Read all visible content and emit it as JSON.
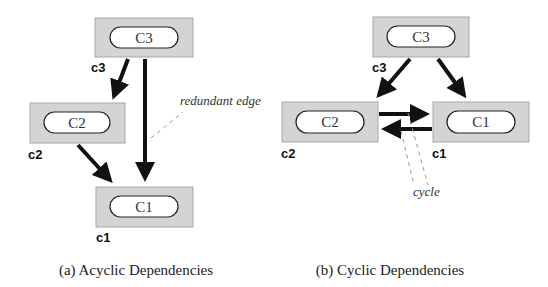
{
  "figure": {
    "subfigures": [
      {
        "id": "a",
        "caption": "(a) Acyclic Dependencies",
        "nodes": [
          {
            "id": "c3",
            "label": "C3",
            "tag": "c3"
          },
          {
            "id": "c2",
            "label": "C2",
            "tag": "c2"
          },
          {
            "id": "c1",
            "label": "C1",
            "tag": "c1"
          }
        ],
        "edges": [
          {
            "from": "c3",
            "to": "c2"
          },
          {
            "from": "c2",
            "to": "c1"
          },
          {
            "from": "c3",
            "to": "c1",
            "annotation": "redundant edge"
          }
        ],
        "annotation": "redundant edge"
      },
      {
        "id": "b",
        "caption": "(b) Cyclic Dependencies",
        "nodes": [
          {
            "id": "c3",
            "label": "C3",
            "tag": "c3"
          },
          {
            "id": "c2",
            "label": "C2",
            "tag": "c2"
          },
          {
            "id": "c1",
            "label": "C1",
            "tag": "c1"
          }
        ],
        "edges": [
          {
            "from": "c3",
            "to": "c2"
          },
          {
            "from": "c3",
            "to": "c1"
          },
          {
            "from": "c2",
            "to": "c1"
          },
          {
            "from": "c1",
            "to": "c2"
          }
        ],
        "annotation": "cycle"
      }
    ]
  },
  "colors": {
    "box_fill": "#d4d4d4",
    "pill_fill": "#ffffff",
    "edge": "#111111"
  }
}
